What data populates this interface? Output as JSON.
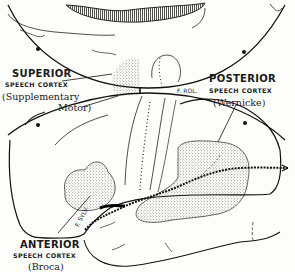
{
  "figure": {
    "colors": {
      "ink": "#1a1a1a",
      "background": "#fdfdfc",
      "stipple": "#444444"
    }
  },
  "labels": {
    "superior": {
      "title": "SUPERIOR",
      "sub": "SPEECH CORTEX",
      "name_line1": "(Supplementary",
      "name_line2": "Motor)"
    },
    "posterior": {
      "title": "POSTERIOR",
      "sub": "SPEECH CORTEX",
      "name": "(Wernicke)"
    },
    "anterior": {
      "title": "ANTERIOR",
      "sub": "SPEECH CORTEX",
      "name": "(Broca)"
    },
    "fissure_rolando": "F. ROL.",
    "fissure_sylvius": "F. SYLV."
  }
}
